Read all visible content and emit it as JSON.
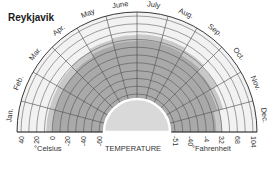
{
  "chart_data": {
    "type": "area",
    "subtype": "radial-semicircle",
    "title": "Reykjavik",
    "center_label": "TEMPERATURE",
    "months": [
      "Jan.",
      "Feb.",
      "Mar.",
      "Apr.",
      "May",
      "June",
      "July",
      "Aug.",
      "Sep.",
      "Oct.",
      "Nov.",
      "Dec."
    ],
    "celsius_ticks": [
      "40",
      "20",
      "0",
      "-20",
      "-40",
      "-60"
    ],
    "fahrenheit_ticks": [
      "-51",
      "-40",
      "-4",
      "32",
      "68",
      "104"
    ],
    "celsius_label": "°Celsius",
    "fahrenheit_label": "°Fahrenheit",
    "radial_range_celsius": [
      -60,
      40
    ],
    "shaded_range_upper_celsius": [
      0,
      0,
      1,
      3,
      6,
      8,
      9,
      8,
      5,
      2,
      -2,
      -7
    ],
    "shaded_range_lower_celsius": -60,
    "grid": true,
    "colors": {
      "shaded": "#a9a9a9",
      "shaded_transition": "#c8c8c8",
      "background": "#f2f2f2",
      "grid": "#444444",
      "center": "#d9d9d9"
    }
  },
  "labels": {
    "title": "Reykjavik",
    "temperature": "TEMPERATURE",
    "celsius": "°Celsius",
    "fahrenheit": "°Fahrenheit"
  }
}
